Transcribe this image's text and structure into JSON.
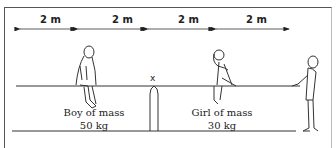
{
  "diagram": {
    "distances": [
      {
        "label": "2 m"
      },
      {
        "label": "2 m"
      },
      {
        "label": "2 m"
      },
      {
        "label": "2 m"
      }
    ],
    "pivot": {
      "label": "x"
    },
    "boy": {
      "line1": "Boy of mass",
      "line2": "50 kg"
    },
    "girl": {
      "line1": "Girl of mass",
      "line2": "30 kg"
    },
    "colors": {
      "line": "#333333",
      "background": "#ffffff"
    }
  }
}
